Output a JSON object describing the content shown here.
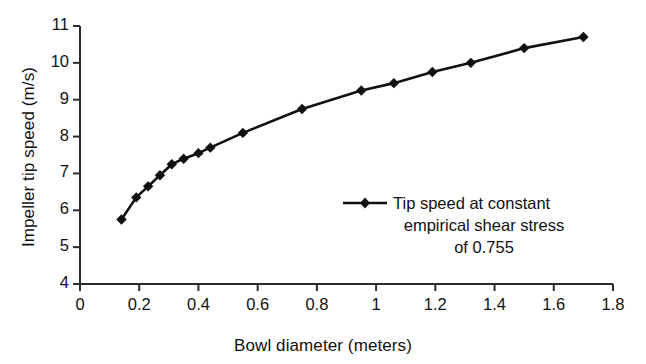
{
  "chart_data": {
    "type": "line",
    "title": "",
    "xlabel": "Bowl diameter (meters)",
    "ylabel": "Impeller tip speed (m/s)",
    "xlim": [
      0,
      1.8
    ],
    "ylim": [
      4,
      11
    ],
    "xticks": [
      "0",
      "0.2",
      "0.4",
      "0.6",
      "0.8",
      "1",
      "1.2",
      "1.4",
      "1.6",
      "1.8"
    ],
    "xtick_values": [
      0,
      0.2,
      0.4,
      0.6,
      0.8,
      1.0,
      1.2,
      1.4,
      1.6,
      1.8
    ],
    "yticks": [
      "4",
      "5",
      "6",
      "7",
      "8",
      "9",
      "10",
      "11"
    ],
    "ytick_values": [
      4,
      5,
      6,
      7,
      8,
      9,
      10,
      11
    ],
    "grid": false,
    "legend_position": "inside-lower-right",
    "series": [
      {
        "name": "Tip speed at constant empirical shear stress of 0.755",
        "marker": "diamond",
        "color": "#111111",
        "x": [
          0.14,
          0.19,
          0.23,
          0.27,
          0.31,
          0.35,
          0.4,
          0.44,
          0.55,
          0.75,
          0.95,
          1.06,
          1.19,
          1.32,
          1.5,
          1.7
        ],
        "y": [
          5.75,
          6.35,
          6.65,
          6.95,
          7.25,
          7.4,
          7.55,
          7.7,
          8.1,
          8.75,
          9.25,
          9.45,
          9.75,
          10.0,
          10.4,
          10.7
        ]
      }
    ],
    "legend": {
      "lines": [
        "Tip speed at constant",
        "empirical shear stress",
        "of 0.755"
      ]
    }
  },
  "axes": {
    "x_axis_name": "bowl-diameter-axis",
    "y_axis_name": "impeller-tip-speed-axis"
  }
}
